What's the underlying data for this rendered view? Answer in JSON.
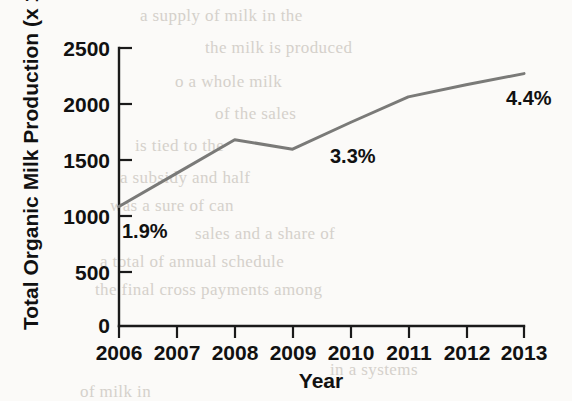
{
  "figure": {
    "name": "organic-milk-production-line-chart",
    "line_color": "#7a7a78",
    "axis_color": "#1a1a1a",
    "background": "#fbfaf8"
  },
  "chart_data": {
    "type": "line",
    "title": "",
    "xlabel": "Year",
    "ylabel": "Total Organic Milk Production (x 10⁶ lb)",
    "ylabel_main": "Total Organic Milk Production (x 10",
    "ylabel_exp": "6",
    "ylabel_tail": " lb)",
    "categories": [
      "2006",
      "2007",
      "2008",
      "2009",
      "2010",
      "2011",
      "2012",
      "2013"
    ],
    "x": [
      2006,
      2007,
      2008,
      2009,
      2010,
      2011,
      2012,
      2013
    ],
    "values": [
      1075,
      1375,
      1675,
      1590,
      1830,
      2060,
      2170,
      2270
    ],
    "series": [
      {
        "name": "Total Organic Milk Production",
        "values": [
          1075,
          1375,
          1675,
          1590,
          1830,
          2060,
          2170,
          2270
        ]
      }
    ],
    "xlim": [
      2006,
      2013
    ],
    "ylim": [
      0,
      2500
    ],
    "ytick_labels": [
      "2500",
      "2000",
      "1500",
      "1000",
      "500",
      "0"
    ],
    "yticks": [
      2500,
      2000,
      1500,
      1000,
      500,
      0
    ],
    "xtick_labels": [
      "2006",
      "2007",
      "2008",
      "2009",
      "2010",
      "2011",
      "2012",
      "2013"
    ],
    "grid": false,
    "legend": "none",
    "annotations": [
      {
        "text": "1.9%",
        "x": 2006,
        "y": 1000,
        "note": "share of total milk production in 2006"
      },
      {
        "text": "3.3%",
        "x": 2010,
        "y": 1700,
        "note": "share of total milk production in 2010"
      },
      {
        "text": "4.4%",
        "x": 2013,
        "y": 2070,
        "note": "share of total milk production in 2013"
      }
    ]
  },
  "bleed_text": {
    "lines": [
      "a supply of milk in the",
      "the milk is produced",
      "o a whole milk",
      "of the sales",
      "is tied to the",
      "a subsidy and half",
      "was a sure of can",
      "sales and a share of",
      "a total of annual schedule",
      "the final cross payments among",
      "in a systems",
      "of milk in"
    ]
  }
}
